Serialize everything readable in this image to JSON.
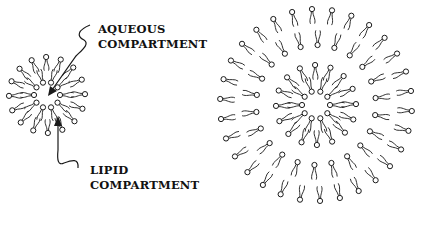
{
  "figure": {
    "panel_a": {
      "description": "Reverse micelle: lipid heads pointing inward around an aqueous core",
      "annotations": [
        {
          "line1": "AQUEOUS",
          "line2": "COMPARTMENT",
          "x": 98,
          "y": 22
        },
        {
          "line1": "LIPID",
          "line2": "COMPARTMENT",
          "x": 90,
          "y": 163
        }
      ],
      "center": [
        47,
        95
      ],
      "inner_ring": {
        "count": 10,
        "radius": 13,
        "orientation": "head-in"
      },
      "outer_ring": {
        "count": 16,
        "radius": 38,
        "orientation": "head-out"
      }
    },
    "panel_b": {
      "description": "Larger multilamellar lipid assembly with concentric layers",
      "center": [
        316,
        105
      ],
      "rings": [
        {
          "count": 10,
          "radius": 14,
          "orientation": "head-in"
        },
        {
          "count": 16,
          "radius": 40,
          "orientation": "head-out"
        },
        {
          "count": 22,
          "radius": 60,
          "orientation": "head-in"
        },
        {
          "count": 30,
          "radius": 96,
          "orientation": "head-out"
        }
      ]
    }
  },
  "colors": {
    "ink": "#1a1a1a",
    "background": "#ffffff"
  }
}
